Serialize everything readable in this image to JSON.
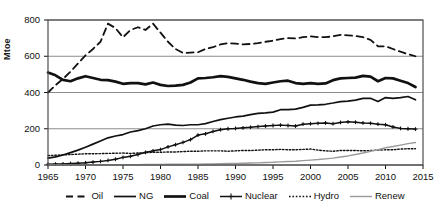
{
  "chart_data": {
    "type": "line",
    "title": "",
    "xlabel": "",
    "ylabel": "Mtoe",
    "xlim": [
      1965,
      2015
    ],
    "ylim": [
      0,
      800
    ],
    "grid": true,
    "legend_position": "bottom",
    "ytick_labels": [
      "0",
      "200",
      "400",
      "600",
      "800"
    ],
    "ytick_values": [
      0,
      200,
      400,
      600,
      800
    ],
    "xtick_labels": [
      "1965",
      "1970",
      "1975",
      "1980",
      "1985",
      "1990",
      "1995",
      "2000",
      "2005",
      "2010",
      "2015"
    ],
    "xtick_values": [
      1965,
      1970,
      1975,
      1980,
      1985,
      1990,
      1995,
      2000,
      2005,
      2010,
      2015
    ],
    "x": [
      1965,
      1966,
      1967,
      1968,
      1969,
      1970,
      1971,
      1972,
      1973,
      1974,
      1975,
      1976,
      1977,
      1978,
      1979,
      1980,
      1981,
      1982,
      1983,
      1984,
      1985,
      1986,
      1987,
      1988,
      1989,
      1990,
      1991,
      1992,
      1993,
      1994,
      1995,
      1996,
      1997,
      1998,
      1999,
      2000,
      2001,
      2002,
      2003,
      2004,
      2005,
      2006,
      2007,
      2008,
      2009,
      2010,
      2011,
      2012,
      2013,
      2014
    ],
    "series": [
      {
        "name": "Oil",
        "style": "dashed",
        "color": "#111111",
        "values": [
          400,
          440,
          475,
          515,
          560,
          605,
          640,
          680,
          780,
          755,
          705,
          745,
          760,
          745,
          780,
          730,
          680,
          640,
          618,
          620,
          622,
          640,
          650,
          665,
          672,
          670,
          665,
          668,
          672,
          680,
          686,
          695,
          700,
          698,
          705,
          710,
          706,
          705,
          710,
          718,
          715,
          712,
          705,
          690,
          655,
          655,
          640,
          625,
          612,
          600
        ]
      },
      {
        "name": "NG",
        "style": "solid-thin",
        "color": "#111111",
        "values": [
          38,
          45,
          55,
          68,
          82,
          98,
          115,
          132,
          150,
          160,
          168,
          182,
          190,
          200,
          215,
          222,
          225,
          220,
          218,
          222,
          222,
          228,
          240,
          250,
          258,
          265,
          270,
          278,
          285,
          288,
          292,
          305,
          305,
          308,
          318,
          330,
          332,
          335,
          342,
          350,
          352,
          358,
          368,
          368,
          350,
          372,
          368,
          372,
          378,
          360
        ]
      },
      {
        "name": "Coal",
        "style": "solid-thick",
        "color": "#111111",
        "values": [
          510,
          495,
          470,
          462,
          478,
          490,
          480,
          470,
          468,
          460,
          448,
          452,
          452,
          445,
          455,
          442,
          436,
          438,
          442,
          455,
          478,
          480,
          484,
          490,
          486,
          478,
          470,
          460,
          452,
          448,
          455,
          462,
          465,
          452,
          448,
          452,
          448,
          450,
          468,
          478,
          480,
          482,
          492,
          488,
          462,
          480,
          478,
          465,
          452,
          430
        ]
      },
      {
        "name": "Nuclear",
        "style": "marker-plus",
        "color": "#111111",
        "values": [
          4,
          5,
          6,
          8,
          10,
          12,
          16,
          20,
          25,
          32,
          42,
          48,
          58,
          70,
          78,
          85,
          100,
          112,
          125,
          140,
          165,
          172,
          185,
          195,
          200,
          202,
          205,
          208,
          212,
          215,
          218,
          220,
          218,
          215,
          225,
          228,
          230,
          232,
          228,
          235,
          238,
          236,
          232,
          230,
          225,
          222,
          210,
          202,
          200,
          198
        ]
      },
      {
        "name": "Hydro",
        "style": "dotted",
        "color": "#111111",
        "values": [
          52,
          54,
          56,
          58,
          60,
          62,
          62,
          63,
          64,
          65,
          66,
          64,
          66,
          68,
          70,
          70,
          72,
          72,
          74,
          76,
          76,
          78,
          78,
          78,
          76,
          78,
          80,
          80,
          82,
          84,
          84,
          86,
          84,
          84,
          86,
          88,
          82,
          78,
          76,
          80,
          80,
          80,
          78,
          80,
          82,
          84,
          84,
          88,
          90,
          90
        ]
      },
      {
        "name": "Renew",
        "style": "solid-light",
        "color": "#9a9a9a",
        "values": [
          1,
          1,
          1,
          1,
          1,
          1,
          1,
          2,
          2,
          2,
          2,
          2,
          2,
          3,
          3,
          3,
          4,
          4,
          4,
          5,
          5,
          6,
          6,
          7,
          8,
          9,
          10,
          11,
          12,
          14,
          15,
          17,
          19,
          21,
          24,
          27,
          30,
          34,
          38,
          44,
          50,
          58,
          66,
          76,
          84,
          95,
          102,
          110,
          118,
          124
        ]
      }
    ]
  },
  "legend": {
    "items": [
      {
        "label": "Oil"
      },
      {
        "label": "NG"
      },
      {
        "label": "Coal"
      },
      {
        "label": "Nuclear"
      },
      {
        "label": "Hydro"
      },
      {
        "label": "Renew"
      }
    ]
  }
}
